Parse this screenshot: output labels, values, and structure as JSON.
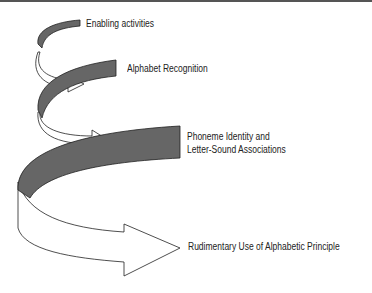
{
  "diagram": {
    "type": "spiral-progression",
    "colors": {
      "band_fill": "#666666",
      "arrow_fill": "#ffffff",
      "stroke": "#222222",
      "top_rule": "#555555"
    },
    "stages": [
      {
        "label": "Enabling activities"
      },
      {
        "label": "Alphabet Recognition"
      },
      {
        "label_line1": "Phoneme Identity and",
        "label_line2": "Letter-Sound Associations"
      },
      {
        "label": "Rudimentary Use of Alphabetic Principle"
      }
    ]
  }
}
